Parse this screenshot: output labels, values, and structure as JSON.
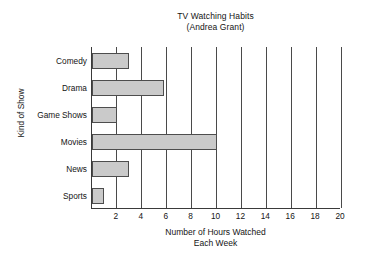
{
  "chart_data": {
    "type": "bar",
    "orientation": "horizontal",
    "title": "TV Watching Habits",
    "subtitle": "(Andrea Grant)",
    "categories": [
      "Comedy",
      "Drama",
      "Game Shows",
      "Movies",
      "News",
      "Sports"
    ],
    "values": [
      3,
      5.8,
      2,
      10,
      3,
      1
    ],
    "series": [
      {
        "name": "Hours Watched Each Week",
        "values": [
          3,
          5.8,
          2,
          10,
          3,
          1
        ]
      }
    ],
    "xlabel": "Number of Hours Watched",
    "xlabel_line2": "Each Week",
    "ylabel": "Kind of Show",
    "xlim": [
      0,
      20
    ],
    "xticks": [
      2,
      4,
      6,
      8,
      10,
      12,
      14,
      16,
      18,
      20
    ],
    "xtick_labels": [
      "2",
      "4",
      "6",
      "8",
      "10",
      "12",
      "14",
      "16",
      "18",
      "20"
    ],
    "grid": "vertical",
    "legend": "none",
    "bar_fill_color": "#cacaca",
    "bar_border_color": "#4d4d4d",
    "axis_color": "#3a3a3a",
    "gridline_color": "#4a4a4a",
    "background_color": "#ffffff"
  }
}
